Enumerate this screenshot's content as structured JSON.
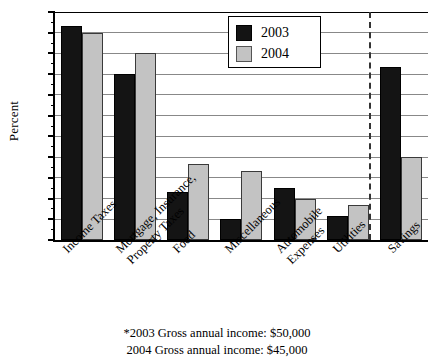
{
  "chart_data": {
    "type": "bar",
    "title": "",
    "xlabel": "",
    "ylabel": "Percent",
    "ylim": [
      0,
      33
    ],
    "ytick_step": 3,
    "yticks": [
      0,
      3,
      6,
      9,
      12,
      15,
      18,
      21,
      24,
      27,
      30,
      33
    ],
    "grid": true,
    "legend_position": "top-center",
    "categories": [
      "Income Taxes",
      "Mortgage, Insurance,\nProperty Taxes",
      "Food",
      "Miscellaneous",
      "Automobile\nExpenses",
      "Utilities",
      "Savings"
    ],
    "category_lines": [
      [
        "Income Taxes"
      ],
      [
        "Mortgage, Insurance,",
        "Property Taxes"
      ],
      [
        "Food"
      ],
      [
        "Miscellaneous"
      ],
      [
        "Automobile",
        "Expenses"
      ],
      [
        "Utilities"
      ],
      [
        "Savings"
      ]
    ],
    "series": [
      {
        "name": "2003",
        "color": "#141414",
        "values": [
          31,
          24,
          7,
          3,
          7.5,
          3.5,
          25
        ]
      },
      {
        "name": "2004",
        "color": "#c3c3c3",
        "values": [
          30,
          27,
          11,
          10,
          6,
          5,
          12
        ]
      }
    ],
    "annotations": [
      {
        "type": "vertical-dashed-separator",
        "after_category": "Utilities"
      }
    ]
  },
  "legend": {
    "entries": [
      {
        "label": "2003"
      },
      {
        "label": "2004"
      }
    ]
  },
  "footnotes": {
    "line1": "*2003 Gross annual income:  $50,000",
    "line2": "2004 Gross annual income:  $45,000"
  }
}
